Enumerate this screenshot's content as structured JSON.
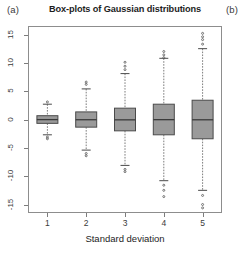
{
  "panels": {
    "left_label": "(a)",
    "right_label": "(b)"
  },
  "chart_data": {
    "type": "boxplot",
    "title": "Box-plots of Gaussian distributions",
    "xlabel": "Standard deviation",
    "ylabel": "",
    "categories": [
      "1",
      "2",
      "3",
      "4",
      "5"
    ],
    "xlim": [
      0.5,
      5.5
    ],
    "ylim": [
      -16.5,
      16.5
    ],
    "yticks": [
      15,
      10,
      5,
      0,
      -5,
      -10,
      -15
    ],
    "ytick_labels": [
      "15",
      "10",
      "5",
      "0",
      "-5",
      "-10",
      "-15"
    ],
    "xticks": [
      1,
      2,
      3,
      4,
      5
    ],
    "xtick_labels": [
      "1",
      "2",
      "3",
      "4",
      "5"
    ],
    "grid": false,
    "legend": false,
    "box_fill_color": "#9a9a9a",
    "box_line_color": "#4a4a4a",
    "whisker_color": "#6e6e6e",
    "outlier_color": "#555555",
    "frame_color": "#8d8d8d",
    "boxes": [
      {
        "category": "1",
        "x": 1,
        "whisker_low": -2.7,
        "q1": -0.68,
        "median": -0.02,
        "q3": 0.67,
        "whisker_high": 2.7,
        "outliers": [
          -3.1,
          3.1,
          -3.4
        ]
      },
      {
        "category": "2",
        "x": 2,
        "whisker_low": -5.4,
        "q1": -1.35,
        "median": -0.04,
        "q3": 1.34,
        "whisker_high": 5.4,
        "outliers": [
          -6.0,
          6.2,
          -6.4,
          6.6
        ]
      },
      {
        "category": "3",
        "x": 3,
        "whisker_low": -8.1,
        "q1": -2.0,
        "median": -0.06,
        "q3": 2.0,
        "whisker_high": 8.1,
        "outliers": [
          8.8,
          9.4,
          -8.8,
          10.1,
          -9.2
        ]
      },
      {
        "category": "4",
        "x": 4,
        "whisker_low": -10.8,
        "q1": -2.7,
        "median": -0.03,
        "q3": 2.7,
        "whisker_high": 10.8,
        "outliers": [
          11.4,
          12.0,
          -11.6,
          -12.5,
          -13.6,
          10.9
        ]
      },
      {
        "category": "5",
        "x": 5,
        "whisker_low": -12.5,
        "q1": -3.4,
        "median": -0.05,
        "q3": 3.4,
        "whisker_high": 12.5,
        "outliers": [
          13.3,
          14.1,
          14.6,
          15.2,
          -13.4,
          -15.0,
          -15.6
        ]
      }
    ]
  }
}
